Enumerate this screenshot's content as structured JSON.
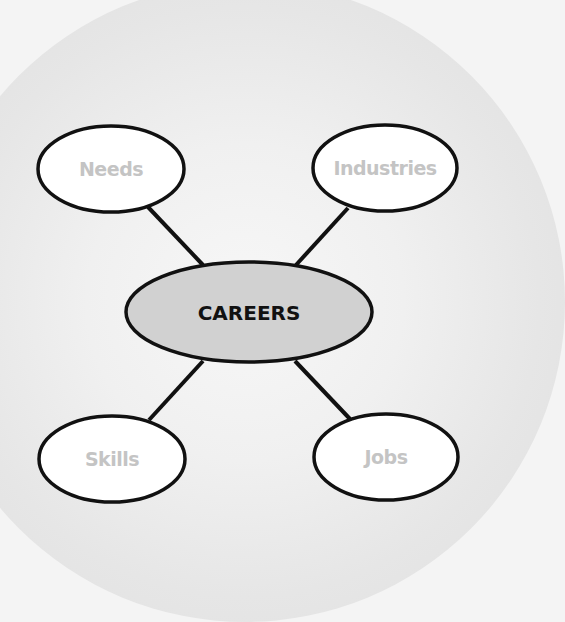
{
  "diagram": {
    "type": "mind-map",
    "background": {
      "outer_color": "#f4f4f4",
      "circle_color": "#e2e2e2"
    },
    "center": {
      "label": "CAREERS",
      "cx": 249,
      "cy": 312,
      "rx": 123,
      "ry": 50,
      "fill": "#d1d1d1",
      "text_color": "#111111"
    },
    "nodes": [
      {
        "id": "needs",
        "label": "Needs",
        "cx": 111,
        "cy": 169,
        "rx": 73,
        "ry": 43,
        "fill": "#ffffff",
        "text_color": "#c4c4c4"
      },
      {
        "id": "industries",
        "label": "Industries",
        "cx": 385,
        "cy": 168,
        "rx": 72,
        "ry": 43,
        "fill": "#ffffff",
        "text_color": "#c4c4c4"
      },
      {
        "id": "skills",
        "label": "Skills",
        "cx": 112,
        "cy": 459,
        "rx": 73,
        "ry": 43,
        "fill": "#ffffff",
        "text_color": "#c4c4c4"
      },
      {
        "id": "jobs",
        "label": "Jobs",
        "cx": 386,
        "cy": 457,
        "rx": 72,
        "ry": 43,
        "fill": "#ffffff",
        "text_color": "#c4c4c4"
      }
    ],
    "edges": [
      {
        "from": "center",
        "to": "needs",
        "x1": 203,
        "y1": 265,
        "x2": 148,
        "y2": 207
      },
      {
        "from": "center",
        "to": "industries",
        "x1": 296,
        "y1": 265,
        "x2": 348,
        "y2": 208
      },
      {
        "from": "center",
        "to": "skills",
        "x1": 203,
        "y1": 361,
        "x2": 149,
        "y2": 420
      },
      {
        "from": "center",
        "to": "jobs",
        "x1": 295,
        "y1": 361,
        "x2": 350,
        "y2": 419
      }
    ],
    "stroke_color": "#111111"
  }
}
